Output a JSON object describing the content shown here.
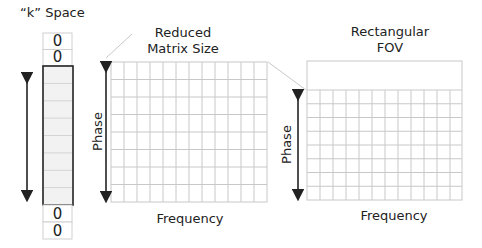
{
  "kspace": {
    "title": "“k” Space",
    "top_cells": [
      "0",
      "0"
    ],
    "bottom_cells": [
      "0",
      "0"
    ],
    "data_rows": 8,
    "fill_color": "#f2f2f2",
    "border_color": "#222222"
  },
  "reduced_matrix": {
    "title_line1": "Reduced",
    "title_line2": "Matrix Size",
    "y_axis_label": "Phase",
    "x_axis_label": "Frequency",
    "columns": 12,
    "rows": 8
  },
  "rectangular_fov": {
    "title_line1": "Rectangular",
    "title_line2": "FOV",
    "y_axis_label": "Phase",
    "x_axis_label": "Frequency",
    "columns": 12,
    "rows": 8
  },
  "colors": {
    "grid_line": "#c8c8c8",
    "arrow": "#222222",
    "text": "#222222"
  }
}
